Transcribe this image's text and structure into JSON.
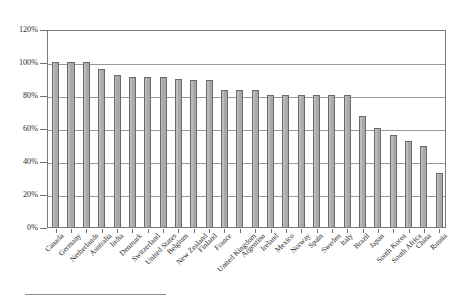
{
  "chart_data": {
    "type": "bar",
    "title": "",
    "subtitle": "",
    "xlabel": "",
    "ylabel": "",
    "ylim": [
      0,
      120
    ],
    "ytick_labels": [
      "0%",
      "20%",
      "40%",
      "60%",
      "80%",
      "100%",
      "120%"
    ],
    "ytick_values": [
      0,
      20,
      40,
      60,
      80,
      100,
      120
    ],
    "grid": true,
    "grid_axis": "y",
    "legend": "none",
    "value_unit": "percent",
    "categories": [
      "Canada",
      "Germany",
      "Netherlands",
      "Australia",
      "India",
      "Denmark",
      "Switzerland",
      "United States",
      "Belgium",
      "New Zealand",
      "Finland",
      "France",
      "United Kingdom",
      "Argentina",
      "Ireland",
      "Mexico",
      "Norway",
      "Spain",
      "Sweden",
      "Italy",
      "Brazil",
      "Japan",
      "South Korea",
      "South Africa",
      "China",
      "Russia"
    ],
    "values": [
      100,
      100,
      100,
      96,
      92,
      91,
      91,
      91,
      90,
      89,
      89,
      83,
      83,
      83,
      80,
      80,
      80,
      80,
      80,
      80,
      67,
      60,
      56,
      52,
      49,
      33
    ],
    "bar_color": "#a9a9a9",
    "bar_border_color": "#6a6a6a",
    "axis_color": "#7a7a7a",
    "gridline_color": "#9a9a9a"
  },
  "footnote": {
    "rule_label": "footnote-separator"
  }
}
